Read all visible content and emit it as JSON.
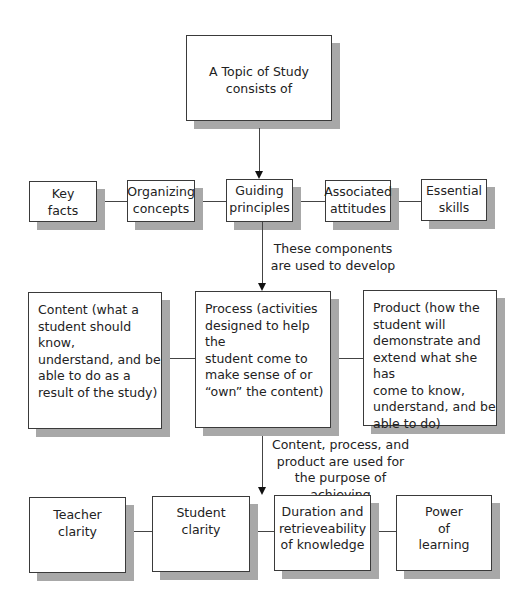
{
  "top": {
    "lines": [
      "A Topic of Study",
      "consists of"
    ]
  },
  "components": [
    {
      "lines": [
        "Key",
        "facts"
      ]
    },
    {
      "lines": [
        "Organizing",
        "concepts"
      ]
    },
    {
      "lines": [
        "Guiding",
        "principles"
      ]
    },
    {
      "lines": [
        "Associated",
        "attitudes"
      ]
    },
    {
      "lines": [
        "Essential",
        "skills"
      ]
    }
  ],
  "connector1": {
    "lines": [
      "These components",
      "are used to develop"
    ]
  },
  "dimensions": [
    {
      "lines": [
        "Content (what a",
        "student should know,",
        "understand, and be",
        "able to do as a",
        "result of the study)"
      ]
    },
    {
      "lines": [
        "Process (activities",
        "designed to help the",
        "student come to",
        "make sense of or",
        "“own” the content)"
      ]
    },
    {
      "lines": [
        "Product (how the",
        "student will",
        "demonstrate and",
        "extend what she has",
        "come to know,",
        "understand, and be",
        "able to do)"
      ]
    }
  ],
  "connector2": {
    "lines": [
      "Content, process, and",
      "product are used for",
      "the purpose of achieving"
    ]
  },
  "outcomes": [
    {
      "lines": [
        "Teacher",
        "clarity"
      ]
    },
    {
      "lines": [
        "Student",
        "clarity"
      ]
    },
    {
      "lines": [
        "Duration and",
        "retrieveability",
        "of knowledge"
      ]
    },
    {
      "lines": [
        "Power",
        "of",
        "learning"
      ]
    }
  ]
}
